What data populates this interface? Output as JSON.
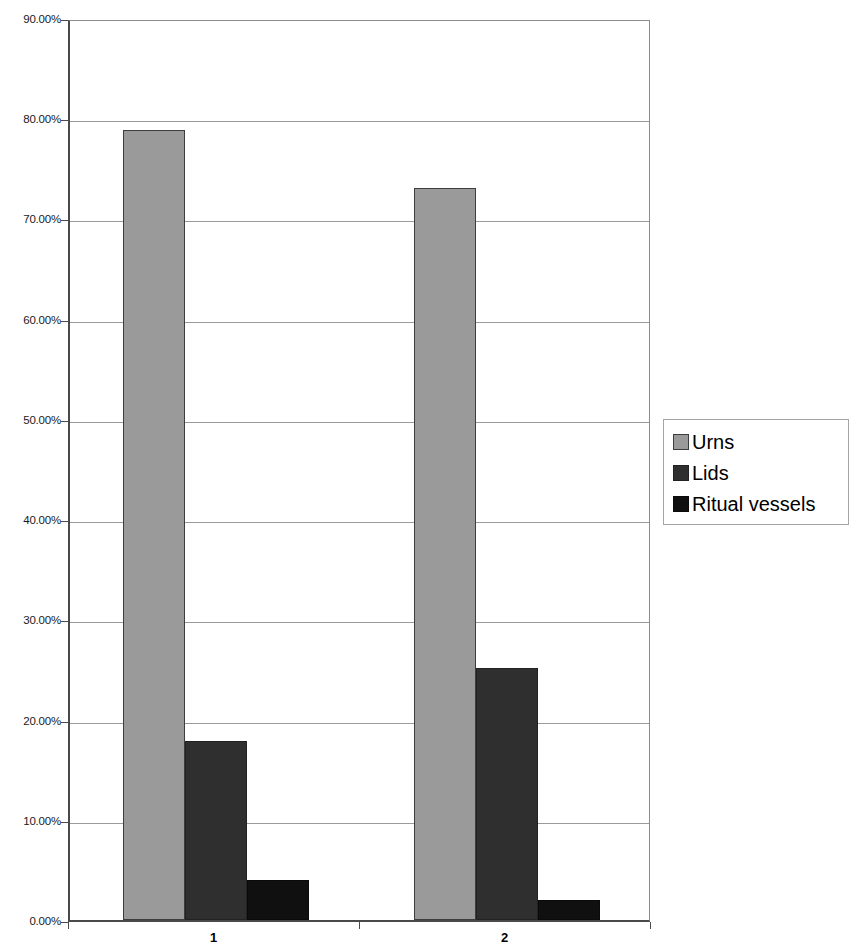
{
  "chart_data": {
    "type": "bar",
    "title": "",
    "subtitle": "",
    "xlabel": "",
    "ylabel": "",
    "categories": [
      "1",
      "2"
    ],
    "series": [
      {
        "name": "Urns",
        "color": "#9a9a9a",
        "values": [
          78.8,
          73.0
        ]
      },
      {
        "name": "Lids",
        "color": "#2f2f2f",
        "values": [
          17.9,
          25.1
        ]
      },
      {
        "name": "Ritual vessels",
        "color": "#101010",
        "values": [
          4.0,
          2.0
        ]
      }
    ],
    "ylim": [
      0,
      90
    ],
    "ytick_values": [
      0,
      10,
      20,
      30,
      40,
      50,
      60,
      70,
      80,
      90
    ],
    "ytick_labels": [
      "0.00%",
      "10.00%",
      "20.00%",
      "30.00%",
      "40.00%",
      "50.00%",
      "60.00%",
      "70.00%",
      "80.00%",
      "90.00%"
    ],
    "grid": true,
    "grid_axis": "y",
    "legend_position": "right",
    "value_format": "percent"
  },
  "legend": {
    "entries": [
      {
        "label": "Urns"
      },
      {
        "label": "Lids"
      },
      {
        "label": "Ritual vessels"
      }
    ]
  },
  "axis": {
    "x_tick_labels": [
      "1",
      "2"
    ],
    "y_tick_labels": [
      "90.00%",
      "80.00%",
      "70.00%",
      "60.00%",
      "50.00%",
      "40.00%",
      "30.00%",
      "20.00%",
      "10.00%",
      "0.00%"
    ]
  }
}
